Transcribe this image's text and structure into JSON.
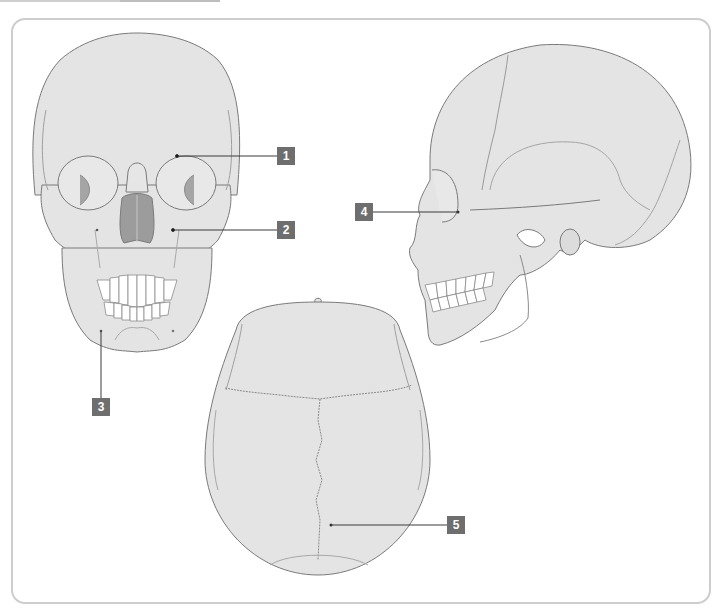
{
  "diagram": {
    "views": [
      {
        "id": "anterior",
        "name": "Anterior (frontal) view"
      },
      {
        "id": "lateral",
        "name": "Lateral view"
      },
      {
        "id": "superior",
        "name": "Superior view"
      }
    ],
    "colors": {
      "bone_fill": "#e4e4e4",
      "outline": "#7a7a7a",
      "suture": "#9a9a9a",
      "cavity": "#9c9c9c",
      "teeth": "#ffffff",
      "label_bg": "#6e6e6e",
      "label_text": "#ffffff",
      "leader": "#3a3a3a",
      "frame_border": "#cdcdcd"
    },
    "labels": [
      {
        "number": "1",
        "x": 277,
        "y": 145,
        "target_x": 177,
        "target_y": 156
      },
      {
        "number": "2",
        "x": 277,
        "y": 218,
        "target_x": 173,
        "target_y": 230
      },
      {
        "number": "3",
        "x": 88,
        "y": 398,
        "target_x": 101,
        "target_y": 331
      },
      {
        "number": "4",
        "x": 355,
        "y": 205,
        "target_x": 458,
        "target_y": 212
      },
      {
        "number": "5",
        "x": 447,
        "y": 512,
        "target_x": 331,
        "target_y": 525
      }
    ]
  }
}
